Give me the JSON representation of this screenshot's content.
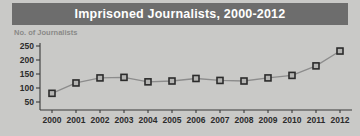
{
  "title": "Imprisoned Journalists, 2000-2012",
  "colors": {
    "banner_bg": "#6d6d6d",
    "banner_text": "#ffffff",
    "page_bg": "#c9c9c7",
    "axis": "#3a3a3a",
    "line": "#8c8c8c",
    "marker_fill": "#b4b4b2",
    "marker_stroke": "#2b2b2b",
    "ylabel_text": "#8a8a88",
    "tick_text": "#2b2b2b"
  },
  "chart_data": {
    "type": "line",
    "title": "Imprisoned Journalists, 2000-2012",
    "xlabel": "",
    "ylabel": "No. of Journalists",
    "categories": [
      "2000",
      "2001",
      "2002",
      "2003",
      "2004",
      "2005",
      "2006",
      "2007",
      "2008",
      "2009",
      "2010",
      "2011",
      "2012"
    ],
    "values": [
      81,
      118,
      136,
      138,
      122,
      125,
      134,
      127,
      125,
      136,
      145,
      179,
      232
    ],
    "ylim": [
      50,
      250
    ],
    "yticks": [
      50,
      100,
      150,
      200,
      250
    ],
    "ytick_labels": [
      "50",
      "100",
      "150",
      "200",
      "250"
    ],
    "grid": false,
    "legend": false,
    "marker": "square"
  }
}
